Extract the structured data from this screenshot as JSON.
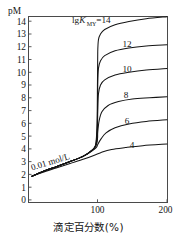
{
  "chart_data": {
    "type": "line",
    "title": "",
    "xlabel": "滴定百分数(%)",
    "ylabel": "pM",
    "xlim": [
      0,
      200
    ],
    "ylim": [
      0,
      14
    ],
    "grid": false,
    "legend_position": "inline-curve-labels",
    "x_ticks": [
      {
        "value": 100,
        "label": "100"
      },
      {
        "value": 200,
        "label": "200"
      }
    ],
    "y_ticks": [
      {
        "value": 14,
        "label": "14"
      },
      {
        "value": 13,
        "label": "13"
      },
      {
        "value": 12,
        "label": "12"
      },
      {
        "value": 11,
        "label": "11"
      },
      {
        "value": 10,
        "label": "10"
      },
      {
        "value": 9,
        "label": "9"
      },
      {
        "value": 8,
        "label": "8"
      },
      {
        "value": 7,
        "label": "7"
      },
      {
        "value": 6,
        "label": "6"
      },
      {
        "value": 5,
        "label": "5"
      },
      {
        "value": 4,
        "label": "4"
      },
      {
        "value": 3,
        "label": "3"
      },
      {
        "value": 2,
        "label": "2"
      },
      {
        "value": 1,
        "label": "1"
      },
      {
        "value": 0,
        "label": "0"
      }
    ],
    "annotations": [
      {
        "name": "concentration",
        "text": "0.01 mol/L",
        "x": 30,
        "y": 2.8,
        "rotation": -18
      },
      {
        "name": "main-parameter",
        "text_plain": "lgK'MY=14",
        "prefix": "lg",
        "symbol": "K",
        "prime": "′",
        "subscript": "MY",
        "equals": "=",
        "value": "14",
        "x": 78,
        "y": 14.1
      }
    ],
    "series": [
      {
        "name": "lgK'MY = 14",
        "label": "14",
        "label_x": 106,
        "label_y": 14.15,
        "color": "#141414",
        "points": [
          [
            5,
            1.85
          ],
          [
            20,
            2.2
          ],
          [
            40,
            2.6
          ],
          [
            60,
            3.0
          ],
          [
            80,
            3.45
          ],
          [
            92,
            3.9
          ],
          [
            97,
            4.3
          ],
          [
            99,
            6.0
          ],
          [
            99.6,
            9.2
          ],
          [
            100,
            11.6
          ],
          [
            101,
            12.55
          ],
          [
            104,
            13.0
          ],
          [
            110,
            13.35
          ],
          [
            125,
            13.72
          ],
          [
            145,
            13.98
          ],
          [
            170,
            14.2
          ],
          [
            200,
            14.35
          ]
        ]
      },
      {
        "name": "lgK'MY = 12",
        "label": "12",
        "label_x": 128,
        "label_y": 12.1,
        "color": "#141414",
        "points": [
          [
            5,
            1.85
          ],
          [
            20,
            2.2
          ],
          [
            40,
            2.6
          ],
          [
            60,
            3.0
          ],
          [
            80,
            3.45
          ],
          [
            92,
            3.9
          ],
          [
            97,
            4.3
          ],
          [
            99,
            5.3
          ],
          [
            99.7,
            7.0
          ],
          [
            100,
            9.0
          ],
          [
            101,
            10.3
          ],
          [
            104,
            10.9
          ],
          [
            110,
            11.3
          ],
          [
            125,
            11.68
          ],
          [
            145,
            11.9
          ],
          [
            170,
            12.05
          ],
          [
            200,
            12.15
          ]
        ]
      },
      {
        "name": "lgK'MY = 10",
        "label": "10",
        "label_x": 128,
        "label_y": 10.25,
        "color": "#141414",
        "points": [
          [
            5,
            1.85
          ],
          [
            20,
            2.2
          ],
          [
            40,
            2.6
          ],
          [
            60,
            3.0
          ],
          [
            80,
            3.45
          ],
          [
            92,
            3.9
          ],
          [
            97,
            4.25
          ],
          [
            99,
            4.8
          ],
          [
            99.7,
            5.7
          ],
          [
            100,
            7.0
          ],
          [
            101,
            8.3
          ],
          [
            104,
            9.0
          ],
          [
            110,
            9.4
          ],
          [
            125,
            9.78
          ],
          [
            145,
            10.0
          ],
          [
            170,
            10.18
          ],
          [
            200,
            10.3
          ]
        ]
      },
      {
        "name": "lgK'MY = 8",
        "label": "8",
        "label_x": 127,
        "label_y": 8.1,
        "color": "#141414",
        "points": [
          [
            5,
            1.85
          ],
          [
            20,
            2.2
          ],
          [
            40,
            2.6
          ],
          [
            60,
            3.0
          ],
          [
            80,
            3.45
          ],
          [
            92,
            3.9
          ],
          [
            97,
            4.2
          ],
          [
            99,
            4.5
          ],
          [
            99.8,
            4.9
          ],
          [
            100,
            5.3
          ],
          [
            102,
            6.2
          ],
          [
            106,
            6.9
          ],
          [
            115,
            7.4
          ],
          [
            130,
            7.7
          ],
          [
            150,
            7.9
          ],
          [
            175,
            8.0
          ],
          [
            200,
            8.08
          ]
        ]
      },
      {
        "name": "lgK'MY = 6",
        "label": "6",
        "label_x": 128,
        "label_y": 6.35,
        "color": "#141414",
        "points": [
          [
            5,
            1.85
          ],
          [
            20,
            2.2
          ],
          [
            40,
            2.6
          ],
          [
            60,
            3.0
          ],
          [
            80,
            3.45
          ],
          [
            92,
            3.85
          ],
          [
            97,
            4.05
          ],
          [
            99,
            4.2
          ],
          [
            100,
            4.35
          ],
          [
            105,
            4.8
          ],
          [
            112,
            5.25
          ],
          [
            125,
            5.65
          ],
          [
            145,
            5.95
          ],
          [
            170,
            6.15
          ],
          [
            200,
            6.28
          ]
        ]
      },
      {
        "name": "lgK'MY = 4",
        "label": "4",
        "label_x": 132,
        "label_y": 4.55,
        "color": "#141414",
        "points": [
          [
            5,
            1.85
          ],
          [
            20,
            2.15
          ],
          [
            40,
            2.5
          ],
          [
            60,
            2.85
          ],
          [
            80,
            3.2
          ],
          [
            95,
            3.5
          ],
          [
            105,
            3.72
          ],
          [
            120,
            3.95
          ],
          [
            140,
            4.1
          ],
          [
            165,
            4.25
          ],
          [
            200,
            4.38
          ]
        ]
      }
    ]
  }
}
